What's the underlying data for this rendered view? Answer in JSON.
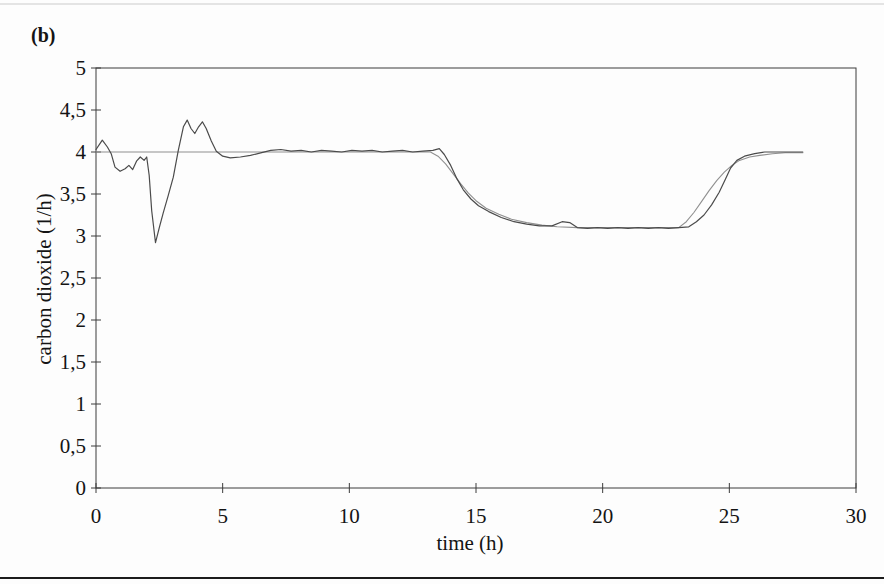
{
  "page": {
    "panel_label": "(b)"
  },
  "chart_data": {
    "type": "line",
    "title": "",
    "xlabel": "time (h)",
    "ylabel": "carbon dioxide (1/h)",
    "xlim": [
      0,
      30
    ],
    "ylim": [
      0,
      5
    ],
    "grid": false,
    "frame": true,
    "legend": "none",
    "decimal_separator": ",",
    "axis_color": "#3c3c3c",
    "label_color": "#141414",
    "x_ticks": [
      {
        "value": 0,
        "label": "0"
      },
      {
        "value": 5,
        "label": "5"
      },
      {
        "value": 10,
        "label": "10"
      },
      {
        "value": 15,
        "label": "15"
      },
      {
        "value": 20,
        "label": "20"
      },
      {
        "value": 25,
        "label": "25"
      },
      {
        "value": 30,
        "label": "30"
      }
    ],
    "y_ticks": [
      {
        "value": 0,
        "label": "0"
      },
      {
        "value": 0.5,
        "label": "0,5"
      },
      {
        "value": 1,
        "label": "1"
      },
      {
        "value": 1.5,
        "label": "1,5"
      },
      {
        "value": 2,
        "label": "2"
      },
      {
        "value": 2.5,
        "label": "2,5"
      },
      {
        "value": 3,
        "label": "3"
      },
      {
        "value": 3.5,
        "label": "3,5"
      },
      {
        "value": 4,
        "label": "4"
      },
      {
        "value": 4.5,
        "label": "4,5"
      },
      {
        "value": 5,
        "label": "5"
      }
    ],
    "series": [
      {
        "name": "smooth-line",
        "color": "#909090",
        "width": 1.1,
        "points": [
          [
            0,
            4.0
          ],
          [
            13.2,
            4.0
          ],
          [
            13.5,
            3.95
          ],
          [
            13.8,
            3.86
          ],
          [
            14.1,
            3.74
          ],
          [
            14.4,
            3.62
          ],
          [
            14.7,
            3.51
          ],
          [
            15.0,
            3.42
          ],
          [
            15.4,
            3.33
          ],
          [
            15.9,
            3.26
          ],
          [
            16.4,
            3.2
          ],
          [
            17.0,
            3.16
          ],
          [
            17.6,
            3.13
          ],
          [
            18.2,
            3.11
          ],
          [
            19.0,
            3.1
          ],
          [
            20.0,
            3.1
          ],
          [
            21.0,
            3.1
          ],
          [
            22.0,
            3.1
          ],
          [
            23.0,
            3.1
          ],
          [
            23.3,
            3.17
          ],
          [
            23.6,
            3.28
          ],
          [
            23.9,
            3.41
          ],
          [
            24.2,
            3.54
          ],
          [
            24.5,
            3.66
          ],
          [
            24.8,
            3.76
          ],
          [
            25.1,
            3.84
          ],
          [
            25.4,
            3.9
          ],
          [
            25.8,
            3.94
          ],
          [
            26.2,
            3.96
          ],
          [
            26.7,
            3.98
          ],
          [
            27.2,
            3.99
          ],
          [
            27.9,
            3.99
          ]
        ]
      },
      {
        "name": "noisy-line",
        "color": "#4b4b4b",
        "width": 1.2,
        "points": [
          [
            0,
            4.03
          ],
          [
            0.25,
            4.14
          ],
          [
            0.45,
            4.06
          ],
          [
            0.6,
            3.98
          ],
          [
            0.75,
            3.82
          ],
          [
            0.95,
            3.77
          ],
          [
            1.15,
            3.8
          ],
          [
            1.3,
            3.84
          ],
          [
            1.45,
            3.79
          ],
          [
            1.6,
            3.89
          ],
          [
            1.75,
            3.94
          ],
          [
            1.9,
            3.9
          ],
          [
            2.0,
            3.94
          ],
          [
            2.1,
            3.72
          ],
          [
            2.2,
            3.3
          ],
          [
            2.35,
            2.92
          ],
          [
            2.5,
            3.1
          ],
          [
            2.65,
            3.27
          ],
          [
            2.85,
            3.48
          ],
          [
            3.05,
            3.7
          ],
          [
            3.25,
            4.02
          ],
          [
            3.45,
            4.3
          ],
          [
            3.6,
            4.38
          ],
          [
            3.75,
            4.28
          ],
          [
            3.9,
            4.22
          ],
          [
            4.05,
            4.3
          ],
          [
            4.2,
            4.36
          ],
          [
            4.35,
            4.28
          ],
          [
            4.55,
            4.13
          ],
          [
            4.75,
            4.01
          ],
          [
            5.0,
            3.95
          ],
          [
            5.3,
            3.93
          ],
          [
            5.7,
            3.94
          ],
          [
            6.1,
            3.96
          ],
          [
            6.5,
            3.99
          ],
          [
            6.9,
            4.02
          ],
          [
            7.3,
            4.03
          ],
          [
            7.7,
            4.01
          ],
          [
            8.1,
            4.02
          ],
          [
            8.5,
            4.0
          ],
          [
            8.9,
            4.02
          ],
          [
            9.3,
            4.01
          ],
          [
            9.7,
            4.0
          ],
          [
            10.1,
            4.02
          ],
          [
            10.5,
            4.01
          ],
          [
            10.9,
            4.02
          ],
          [
            11.3,
            4.0
          ],
          [
            11.7,
            4.01
          ],
          [
            12.1,
            4.02
          ],
          [
            12.5,
            4.0
          ],
          [
            12.9,
            4.01
          ],
          [
            13.3,
            4.02
          ],
          [
            13.55,
            4.04
          ],
          [
            13.75,
            3.97
          ],
          [
            14.0,
            3.84
          ],
          [
            14.25,
            3.68
          ],
          [
            14.5,
            3.55
          ],
          [
            14.8,
            3.44
          ],
          [
            15.1,
            3.36
          ],
          [
            15.5,
            3.29
          ],
          [
            16.0,
            3.22
          ],
          [
            16.5,
            3.17
          ],
          [
            17.0,
            3.14
          ],
          [
            17.5,
            3.12
          ],
          [
            18.0,
            3.12
          ],
          [
            18.4,
            3.17
          ],
          [
            18.7,
            3.16
          ],
          [
            19.0,
            3.1
          ],
          [
            19.4,
            3.09
          ],
          [
            19.8,
            3.1
          ],
          [
            20.2,
            3.09
          ],
          [
            20.6,
            3.1
          ],
          [
            21.0,
            3.09
          ],
          [
            21.4,
            3.1
          ],
          [
            21.8,
            3.09
          ],
          [
            22.2,
            3.1
          ],
          [
            22.6,
            3.09
          ],
          [
            23.0,
            3.1
          ],
          [
            23.4,
            3.11
          ],
          [
            23.7,
            3.17
          ],
          [
            24.0,
            3.25
          ],
          [
            24.3,
            3.37
          ],
          [
            24.6,
            3.52
          ],
          [
            24.85,
            3.68
          ],
          [
            25.05,
            3.81
          ],
          [
            25.3,
            3.9
          ],
          [
            25.6,
            3.95
          ],
          [
            26.0,
            3.98
          ],
          [
            26.4,
            4.0
          ],
          [
            26.9,
            4.0
          ],
          [
            27.4,
            4.0
          ],
          [
            27.9,
            4.0
          ]
        ]
      }
    ]
  },
  "decorations": {
    "top_rule_color": "#e4e4e4",
    "bottom_rule_color": "#1c1c1c"
  }
}
